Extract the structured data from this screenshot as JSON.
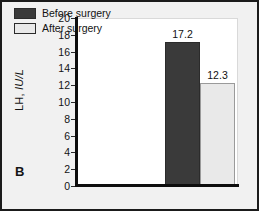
{
  "figure": {
    "panel_label": "B",
    "background_color": "#f1f1f1",
    "frame_color": "#1b1b1b"
  },
  "chart_data": {
    "type": "bar",
    "title": "",
    "xlabel": "",
    "ylabel": "LH, IU/L",
    "ylabel_prefix": "LH, ",
    "ylabel_unit": "IU/L",
    "categories": [
      "Before surgery",
      "After surgery"
    ],
    "values": [
      17.2,
      12.3
    ],
    "value_labels": [
      "17.2",
      "12.3"
    ],
    "ylim": [
      0,
      20
    ],
    "ytick_step": 2,
    "yticks": [
      20,
      18,
      16,
      14,
      12,
      10,
      8,
      6,
      4,
      2,
      0
    ],
    "ytick_labels": [
      "20",
      "18",
      "16",
      "14",
      "12",
      "10",
      "8",
      "6",
      "4",
      "2",
      "0"
    ],
    "grid": false,
    "legend_position": "top-left",
    "series_colors": [
      "#3a3a3a",
      "#e9e9e9"
    ],
    "legend": [
      {
        "label": "Before surgery",
        "color": "#3a3a3a"
      },
      {
        "label": "After surgery",
        "color": "#e9e9e9"
      }
    ]
  }
}
